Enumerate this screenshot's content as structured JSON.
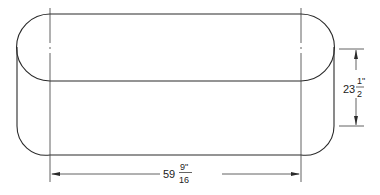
{
  "drawing": {
    "subject": "rounded-end tank / trough elevation view",
    "stroke_color": "#2a2a2a",
    "background": "#ffffff"
  },
  "dimensions": {
    "length": {
      "whole": "59",
      "numerator": "9\"",
      "denominator": "16",
      "orientation": "horizontal"
    },
    "height": {
      "whole": "23",
      "numerator": "1\"",
      "denominator": "2",
      "orientation": "vertical"
    }
  }
}
